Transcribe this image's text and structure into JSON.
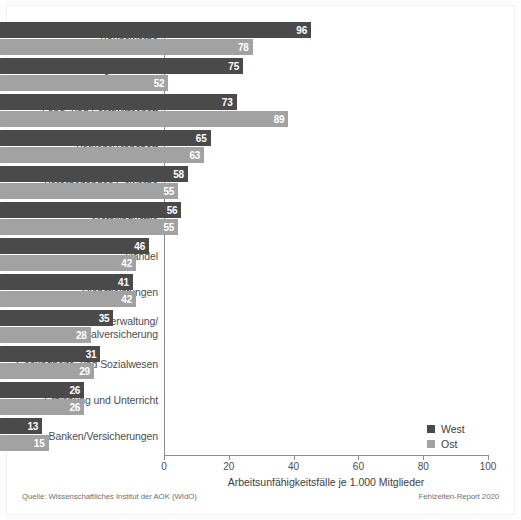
{
  "chart_data": {
    "type": "bar",
    "orientation": "horizontal",
    "title": "",
    "xlabel": "Arbeitsunfähigkeitsfälle je 1.000 Mitglieder",
    "ylabel": "",
    "xlim": [
      0,
      100
    ],
    "xticks": [
      0,
      20,
      40,
      60,
      80,
      100
    ],
    "xtick_labels": [
      "0",
      "20",
      "40",
      "60",
      "80",
      "100"
    ],
    "grid": false,
    "legend_position": "bottom-right",
    "categories": [
      "Baugewerbe",
      "Energie/Wasser/\nEntsorgung/Bergbau",
      "Land- und Forstwirtschaft",
      "Verkehr/Transport",
      "Verarbeitendes Gewerbe",
      "Metallindustrie",
      "Handel",
      "Dienstleistungen",
      "Öffentl. Verwaltung/\nSozialversicherung",
      "Gesundheits- und Sozialwesen",
      "Erziehung und Unterricht",
      "Banken/Versicherungen"
    ],
    "series": [
      {
        "name": "West",
        "color": "#4a4a4a",
        "values": [
          96,
          75,
          73,
          65,
          58,
          56,
          46,
          41,
          35,
          31,
          26,
          13
        ]
      },
      {
        "name": "Ost",
        "color": "#a2a2a2",
        "values": [
          78,
          52,
          89,
          63,
          55,
          55,
          42,
          42,
          28,
          29,
          26,
          15
        ]
      }
    ]
  },
  "legend": {
    "items": [
      {
        "label": "West",
        "color": "#4a4a4a"
      },
      {
        "label": "Ost",
        "color": "#a2a2a2"
      }
    ]
  },
  "footer": {
    "source": "Quelle: Wissenschaftliches Institut der AOK (WIdO)",
    "report": "Fehlzeiten-Report 2020"
  },
  "colors": {
    "west": "#4a4a4a",
    "ost": "#a2a2a2",
    "axis": "#8c8c8c",
    "text": "#4d4d4d",
    "background": "#ffffff"
  }
}
